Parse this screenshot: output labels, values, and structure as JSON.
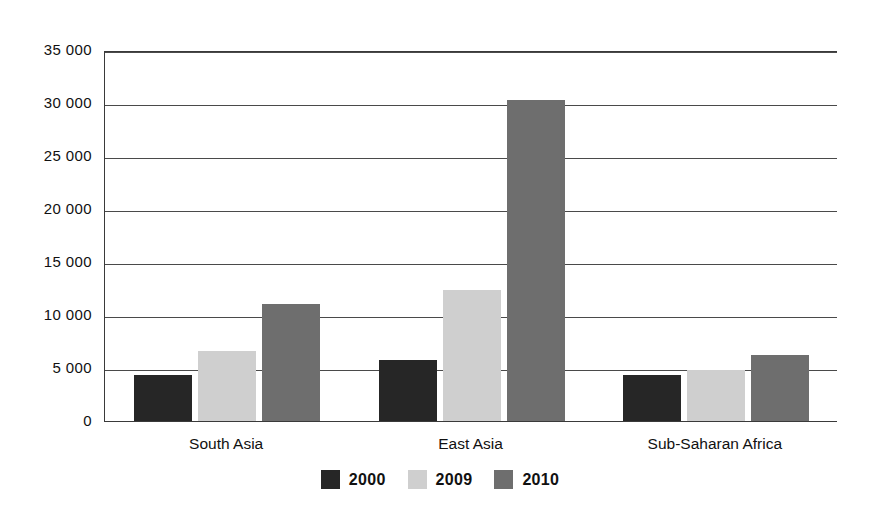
{
  "chart_data": {
    "type": "bar",
    "title": "",
    "subtitle": "",
    "xlabel": "",
    "ylabel": "",
    "categories": [
      "South Asia",
      "East Asia",
      "Sub-Saharan Africa"
    ],
    "series": [
      {
        "name": "2000",
        "color": "#262626",
        "values": [
          4300,
          5800,
          4300
        ]
      },
      {
        "name": "2009",
        "color": "#cfcfcf",
        "values": [
          6600,
          12400,
          4800
        ]
      },
      {
        "name": "2010",
        "color": "#6e6e6e",
        "values": [
          11000,
          30300,
          6200
        ]
      }
    ],
    "ylim": [
      0,
      35000
    ],
    "ytick_values": [
      0,
      5000,
      10000,
      15000,
      20000,
      25000,
      30000,
      35000
    ],
    "ytick_labels": [
      "0",
      "5 000",
      "10 000",
      "15 000",
      "20 000",
      "25 000",
      "30 000",
      "35 000"
    ],
    "grid": true,
    "legend_position": "bottom"
  },
  "legend": {
    "items": [
      {
        "label": "2000",
        "swatch": "legend-swatch-2000"
      },
      {
        "label": "2009",
        "swatch": "legend-swatch-2009"
      },
      {
        "label": "2010",
        "swatch": "legend-swatch-2010"
      }
    ]
  },
  "colors": {
    "series_2000": "#262626",
    "series_2009": "#cfcfcf",
    "series_2010": "#6e6e6e",
    "axis": "#3a3a3a",
    "grid": "#4a4a4a",
    "background": "#ffffff",
    "text": "#111111"
  }
}
